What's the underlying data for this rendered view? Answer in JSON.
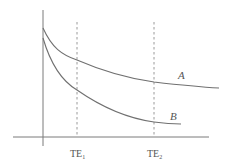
{
  "diagram": {
    "curves": [
      {
        "id": "A",
        "label": "A",
        "points": [
          [
            0,
            0.84
          ],
          [
            0.2,
            0.58
          ],
          [
            0.5,
            0.4
          ],
          [
            1.0,
            0.26
          ],
          [
            1.5,
            0.2
          ],
          [
            2.0,
            0.17
          ]
        ]
      },
      {
        "id": "B",
        "label": "B",
        "points": [
          [
            0,
            0.76
          ],
          [
            0.2,
            0.44
          ],
          [
            0.5,
            0.26
          ],
          [
            1.0,
            0.12
          ],
          [
            1.3,
            0.09
          ],
          [
            1.6,
            0.09
          ]
        ]
      }
    ],
    "markers": [
      {
        "id": "TE1",
        "label": "TE",
        "subscript": "1",
        "x": 0.5
      },
      {
        "id": "TE2",
        "label": "TE",
        "subscript": "2",
        "x": 1.2
      }
    ],
    "x_range": [
      0,
      2.0
    ],
    "y_range": [
      0,
      1.0
    ]
  }
}
